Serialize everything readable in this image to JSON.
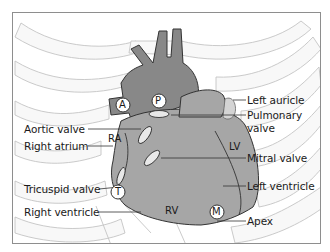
{
  "diagram": {
    "colors": {
      "great_vessels": "#888888",
      "heart_body": "#a6a6a6",
      "ribs_fill": "#f7f7f7",
      "rib_outline": "#c8c8c8",
      "leader_line": "#333333",
      "frame": "#8e8e8e"
    },
    "left_labels": [
      {
        "id": "aortic-valve",
        "text": "Aortic valve"
      },
      {
        "id": "right-atrium",
        "text": "Right atrium"
      },
      {
        "id": "tricuspid-valve",
        "text": "Tricuspid valve"
      },
      {
        "id": "right-ventricle",
        "text": "Right ventricle"
      }
    ],
    "right_labels": [
      {
        "id": "left-auricle",
        "text": "Left auricle"
      },
      {
        "id": "pulmonary-valve",
        "text": "Pulmonary\nvalve",
        "line1": "Pulmonary",
        "line2": "valve"
      },
      {
        "id": "mitral-valve",
        "text": "Mitral valve"
      },
      {
        "id": "left-ventricle",
        "text": "Left ventricle"
      },
      {
        "id": "apex",
        "text": "Apex"
      }
    ],
    "region_labels": {
      "ra": "RA",
      "lv": "LV",
      "rv": "RV"
    },
    "auscultation_points": {
      "a": "A",
      "p": "P",
      "t": "T",
      "m": "M"
    }
  }
}
